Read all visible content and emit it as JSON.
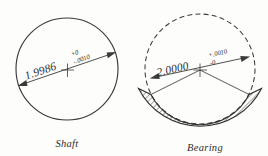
{
  "drawing": {
    "type": "engineering-fit-diagram",
    "background_color": "#fdfdfc",
    "line_color": "#3a3a3a",
    "figures": [
      {
        "id": "shaft",
        "caption": "Shaft",
        "geometry": "solid-circle",
        "center": {
          "x": 67,
          "y": 69
        },
        "radius": 51,
        "dimension": {
          "nominal": "1.9986",
          "tolerance_upper": "+0",
          "tolerance_lower": "-.0010",
          "tolerance_upper_sign": "+",
          "tolerance_upper_value": "0",
          "tolerance_lower_sign": "-",
          "tolerance_lower_value": ".0010"
        }
      },
      {
        "id": "bearing",
        "caption": "Bearing",
        "geometry": "dashed-circle-with-hatched-crescent",
        "center": {
          "x": 200,
          "y": 69
        },
        "radius": 55,
        "dimension": {
          "nominal": "2.0000",
          "tolerance_upper": "+.0010",
          "tolerance_lower": "-0",
          "tolerance_upper_sign": "+",
          "tolerance_upper_value": ".0010",
          "tolerance_lower_sign": "–",
          "tolerance_lower_value": "0"
        }
      }
    ],
    "captions": {
      "shaft": "Shaft",
      "bearing": "Bearing"
    }
  }
}
